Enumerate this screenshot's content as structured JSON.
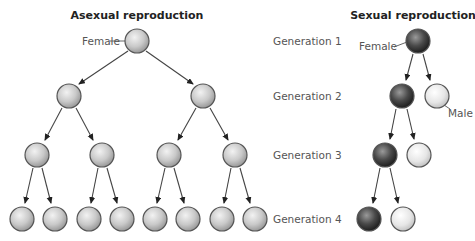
{
  "asexual": {
    "title": "Asexual reproduction",
    "female_label": "Female"
  },
  "sexual": {
    "title": "Sexual reproduction",
    "female_label": "Female",
    "male_label": "Male"
  },
  "generations": [
    {
      "label": "Generation 1"
    },
    {
      "label": "Generation 2"
    },
    {
      "label": "Generation 3"
    },
    {
      "label": "Generation 4"
    }
  ],
  "colors": {
    "female_asexual": "#c8c8c8",
    "female_sexual": "#4a4a4a",
    "male": "#e6e6e6"
  }
}
